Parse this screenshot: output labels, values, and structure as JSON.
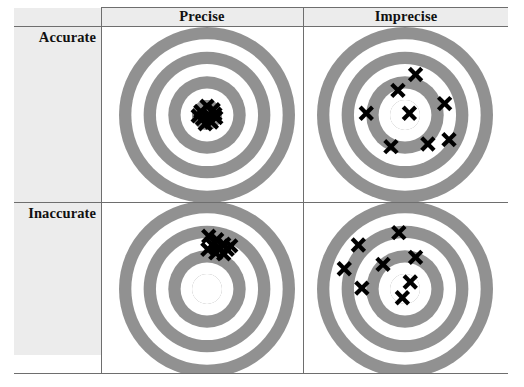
{
  "figure": {
    "column_headers": [
      {
        "id": "precise",
        "label": "Precise"
      },
      {
        "id": "imprecise",
        "label": "Imprecise"
      }
    ],
    "row_headers": [
      {
        "id": "accurate",
        "label": "Accurate"
      },
      {
        "id": "inaccurate",
        "label": "Inaccurate"
      }
    ],
    "colors": {
      "ring_gray": "#919191",
      "ring_white": "#ffffff",
      "band_gray": "#ececec",
      "rule_gray": "#6e6e6e",
      "mark_black": "#000000",
      "text_black": "#111111"
    },
    "target_geometry": {
      "note": "Concentric bullseye: 4 gray rings separated by white gaps; radii as fraction of outer radius",
      "ring_radii": [
        1.0,
        0.86,
        0.72,
        0.58,
        0.44,
        0.3,
        0.17
      ],
      "outer_radius_px": 88
    }
  },
  "cells": [
    {
      "id": "accurate-precise",
      "row": "accurate",
      "column": "precise",
      "description": "Tight cluster of marks centered on the bullseye",
      "center_filled": true,
      "mark_count": 10,
      "marks": [
        {
          "x": 0.0,
          "y": -0.1
        },
        {
          "x": 0.07,
          "y": -0.06
        },
        {
          "x": -0.07,
          "y": -0.04
        },
        {
          "x": 0.02,
          "y": 0.0
        },
        {
          "x": 0.1,
          "y": 0.03
        },
        {
          "x": -0.05,
          "y": 0.04
        },
        {
          "x": 0.05,
          "y": 0.08
        },
        {
          "x": -0.1,
          "y": 0.01
        },
        {
          "x": -0.02,
          "y": 0.1
        },
        {
          "x": 0.09,
          "y": -0.01
        }
      ]
    },
    {
      "id": "accurate-imprecise",
      "row": "accurate",
      "column": "imprecise",
      "description": "Marks widely scattered but averaging on the bullseye",
      "center_filled": false,
      "mark_count": 8,
      "marks": [
        {
          "x": 0.12,
          "y": -0.46
        },
        {
          "x": -0.08,
          "y": -0.28
        },
        {
          "x": 0.45,
          "y": -0.13
        },
        {
          "x": 0.05,
          "y": -0.02
        },
        {
          "x": -0.44,
          "y": -0.02
        },
        {
          "x": -0.16,
          "y": 0.36
        },
        {
          "x": 0.26,
          "y": 0.33
        },
        {
          "x": 0.5,
          "y": 0.28
        }
      ]
    },
    {
      "id": "inaccurate-precise",
      "row": "inaccurate",
      "column": "precise",
      "description": "Tight cluster of marks offset up and to the right of the bullseye",
      "center_filled": false,
      "mark_count": 10,
      "marks": [
        {
          "x": 0.02,
          "y": -0.6
        },
        {
          "x": 0.11,
          "y": -0.56
        },
        {
          "x": 0.19,
          "y": -0.51
        },
        {
          "x": 0.06,
          "y": -0.5
        },
        {
          "x": 0.15,
          "y": -0.46
        },
        {
          "x": 0.23,
          "y": -0.45
        },
        {
          "x": 0.01,
          "y": -0.45
        },
        {
          "x": 0.1,
          "y": -0.41
        },
        {
          "x": 0.19,
          "y": -0.4
        },
        {
          "x": 0.27,
          "y": -0.49
        }
      ]
    },
    {
      "id": "inaccurate-imprecise",
      "row": "inaccurate",
      "column": "imprecise",
      "description": "Marks widely scattered and biased up and to the left of the bullseye",
      "center_filled": false,
      "mark_count": 8,
      "marks": [
        {
          "x": -0.07,
          "y": -0.64
        },
        {
          "x": -0.53,
          "y": -0.5
        },
        {
          "x": 0.12,
          "y": -0.36
        },
        {
          "x": -0.25,
          "y": -0.28
        },
        {
          "x": -0.69,
          "y": -0.23
        },
        {
          "x": -0.49,
          "y": -0.01
        },
        {
          "x": 0.06,
          "y": -0.08
        },
        {
          "x": -0.03,
          "y": 0.1
        }
      ]
    }
  ]
}
